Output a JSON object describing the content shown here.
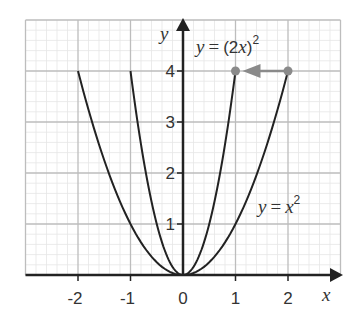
{
  "chart_data": {
    "type": "line",
    "title": "",
    "xlabel": "x",
    "ylabel": "y",
    "xlim": [
      -3,
      3
    ],
    "ylim": [
      0,
      5
    ],
    "grid": true,
    "grid_minor_step": 0.2,
    "x_ticks": [
      -2,
      -1,
      0,
      1,
      2
    ],
    "x_tick_labels": [
      "-2",
      "-1",
      "0",
      "1",
      "2"
    ],
    "y_ticks": [
      1,
      2,
      3,
      4
    ],
    "y_tick_labels": [
      "1",
      "2",
      "3",
      "4"
    ],
    "series": [
      {
        "name": "y = x^2",
        "label": "y = x²",
        "formula": "x^2",
        "domain": [
          -2,
          2
        ],
        "x": [
          -2,
          -1.5,
          -1,
          -0.5,
          0,
          0.5,
          1,
          1.5,
          2
        ],
        "y": [
          4,
          2.25,
          1,
          0.25,
          0,
          0.25,
          1,
          2.25,
          4
        ]
      },
      {
        "name": "y = (2x)^2",
        "label": "y = (2x)²",
        "formula": "(2x)^2",
        "domain": [
          -1,
          1
        ],
        "x": [
          -1,
          -0.75,
          -0.5,
          -0.25,
          0,
          0.25,
          0.5,
          0.75,
          1
        ],
        "y": [
          4,
          2.25,
          1,
          0.25,
          0,
          0.25,
          1,
          2.25,
          4
        ]
      }
    ],
    "annotations": [
      {
        "type": "arrow",
        "from": [
          2,
          4
        ],
        "to": [
          1,
          4
        ],
        "color": "#888888",
        "endpoints": "dots"
      },
      {
        "type": "text",
        "text": "y = (2x)²",
        "at": [
          0.2,
          4.5
        ]
      },
      {
        "type": "text",
        "text": "y = x²",
        "at": [
          1.75,
          1.35
        ]
      }
    ]
  },
  "labels": {
    "x_axis": "x",
    "y_axis": "y",
    "curve_wide_label_y": "y",
    "curve_wide_label_eq": "=",
    "curve_wide_label_x": "x",
    "curve_wide_label_exp": "2",
    "curve_narrow_label_y": "y",
    "curve_narrow_label_eq": "=",
    "curve_narrow_label_open": "(2",
    "curve_narrow_label_x": "x",
    "curve_narrow_label_close": ")",
    "curve_narrow_label_exp": "2"
  },
  "colors": {
    "curve": "#222222",
    "axis": "#222222",
    "grid_major": "#bdbdbd",
    "grid_minor": "#e6e6e6",
    "arrow": "#8a8a8a"
  }
}
